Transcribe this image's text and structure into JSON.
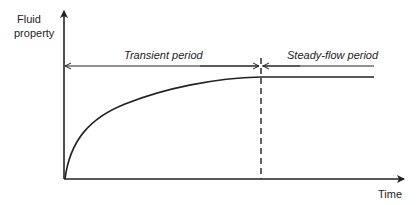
{
  "diagram": {
    "y_axis_label_line1": "Fluid",
    "y_axis_label_line2": "property",
    "x_axis_label": "Time",
    "regions": [
      {
        "label": "Transient period"
      },
      {
        "label": "Steady-flow period"
      }
    ],
    "colors": {
      "line": "#222222",
      "background": "#ffffff"
    }
  }
}
